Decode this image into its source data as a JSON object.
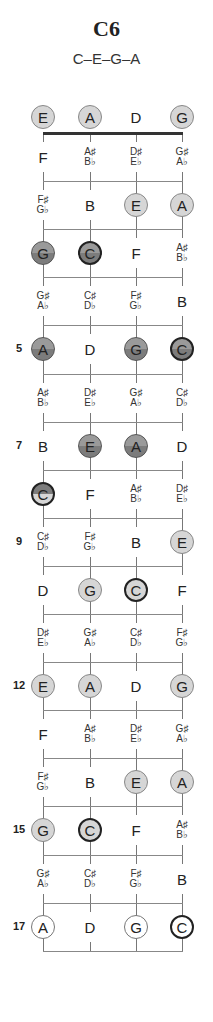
{
  "chord": {
    "name": "C6",
    "notes": "C–E–G–A"
  },
  "diagram": {
    "strings": [
      "E",
      "A",
      "D",
      "G"
    ],
    "string_x": [
      43,
      90,
      136,
      182
    ],
    "nut_y": 133,
    "fret_pitch": 48.1,
    "fret_count": 17,
    "marked_frets": [
      {
        "fret": 5,
        "label": "5"
      },
      {
        "fret": 7,
        "label": "7"
      },
      {
        "fret": 9,
        "label": "9"
      },
      {
        "fret": 12,
        "label": "12"
      },
      {
        "fret": 15,
        "label": "15"
      },
      {
        "fret": 17,
        "label": "17"
      }
    ],
    "rows": [
      {
        "fret": 0,
        "cells": [
          {
            "text": "E",
            "style": "light"
          },
          {
            "text": "A",
            "style": "light"
          },
          {
            "text": "D",
            "style": "none"
          },
          {
            "text": "G",
            "style": "light"
          }
        ]
      },
      {
        "fret": 1,
        "cells": [
          {
            "text": "F",
            "style": "none"
          },
          {
            "sharp": "A♯",
            "flat": "B♭"
          },
          {
            "sharp": "D♯",
            "flat": "E♭"
          },
          {
            "sharp": "G♯",
            "flat": "A♭"
          }
        ]
      },
      {
        "fret": 2,
        "cells": [
          {
            "sharp": "F♯",
            "flat": "G♭"
          },
          {
            "text": "B",
            "style": "none"
          },
          {
            "text": "E",
            "style": "light"
          },
          {
            "text": "A",
            "style": "light"
          }
        ]
      },
      {
        "fret": 3,
        "cells": [
          {
            "text": "G",
            "style": "dark"
          },
          {
            "text": "C",
            "style": "root-dark"
          },
          {
            "text": "F",
            "style": "none"
          },
          {
            "sharp": "A♯",
            "flat": "B♭"
          }
        ]
      },
      {
        "fret": 4,
        "cells": [
          {
            "sharp": "G♯",
            "flat": "A♭"
          },
          {
            "sharp": "C♯",
            "flat": "D♭"
          },
          {
            "sharp": "F♯",
            "flat": "G♭"
          },
          {
            "text": "B",
            "style": "none"
          }
        ]
      },
      {
        "fret": 5,
        "cells": [
          {
            "text": "A",
            "style": "dark"
          },
          {
            "text": "D",
            "style": "none"
          },
          {
            "text": "G",
            "style": "dark"
          },
          {
            "text": "C",
            "style": "root-dark"
          }
        ]
      },
      {
        "fret": 6,
        "cells": [
          {
            "sharp": "A♯",
            "flat": "B♭"
          },
          {
            "sharp": "D♯",
            "flat": "E♭"
          },
          {
            "sharp": "G♯",
            "flat": "A♭"
          },
          {
            "sharp": "C♯",
            "flat": "D♭"
          }
        ]
      },
      {
        "fret": 7,
        "cells": [
          {
            "text": "B",
            "style": "none"
          },
          {
            "text": "E",
            "style": "dark"
          },
          {
            "text": "A",
            "style": "dark"
          },
          {
            "text": "D",
            "style": "none"
          }
        ]
      },
      {
        "fret": 8,
        "cells": [
          {
            "text": "C",
            "style": "root-split"
          },
          {
            "text": "F",
            "style": "none"
          },
          {
            "sharp": "A♯",
            "flat": "B♭"
          },
          {
            "sharp": "D♯",
            "flat": "E♭"
          }
        ]
      },
      {
        "fret": 9,
        "cells": [
          {
            "sharp": "C♯",
            "flat": "D♭"
          },
          {
            "sharp": "F♯",
            "flat": "G♭"
          },
          {
            "text": "B",
            "style": "none"
          },
          {
            "text": "E",
            "style": "light"
          }
        ]
      },
      {
        "fret": 10,
        "cells": [
          {
            "text": "D",
            "style": "none"
          },
          {
            "text": "G",
            "style": "light"
          },
          {
            "text": "C",
            "style": "root-light"
          },
          {
            "text": "F",
            "style": "none"
          }
        ]
      },
      {
        "fret": 11,
        "cells": [
          {
            "sharp": "D♯",
            "flat": "E♭"
          },
          {
            "sharp": "G♯",
            "flat": "A♭"
          },
          {
            "sharp": "C♯",
            "flat": "D♭"
          },
          {
            "sharp": "F♯",
            "flat": "G♭"
          }
        ]
      },
      {
        "fret": 12,
        "cells": [
          {
            "text": "E",
            "style": "light"
          },
          {
            "text": "A",
            "style": "light"
          },
          {
            "text": "D",
            "style": "none"
          },
          {
            "text": "G",
            "style": "light"
          }
        ]
      },
      {
        "fret": 13,
        "cells": [
          {
            "text": "F",
            "style": "none"
          },
          {
            "sharp": "A♯",
            "flat": "B♭"
          },
          {
            "sharp": "D♯",
            "flat": "E♭"
          },
          {
            "sharp": "G♯",
            "flat": "A♭"
          }
        ]
      },
      {
        "fret": 14,
        "cells": [
          {
            "sharp": "F♯",
            "flat": "G♭"
          },
          {
            "text": "B",
            "style": "none"
          },
          {
            "text": "E",
            "style": "light"
          },
          {
            "text": "A",
            "style": "light"
          }
        ]
      },
      {
        "fret": 15,
        "cells": [
          {
            "text": "G",
            "style": "light"
          },
          {
            "text": "C",
            "style": "root-light"
          },
          {
            "text": "F",
            "style": "none"
          },
          {
            "sharp": "A♯",
            "flat": "B♭"
          }
        ]
      },
      {
        "fret": 16,
        "cells": [
          {
            "sharp": "G♯",
            "flat": "A♭"
          },
          {
            "sharp": "C♯",
            "flat": "D♭"
          },
          {
            "sharp": "F♯",
            "flat": "G♭"
          },
          {
            "text": "B",
            "style": "none"
          }
        ]
      },
      {
        "fret": 17,
        "cells": [
          {
            "text": "A",
            "style": "outline"
          },
          {
            "text": "D",
            "style": "none"
          },
          {
            "text": "G",
            "style": "outline"
          },
          {
            "text": "C",
            "style": "root-outline"
          }
        ]
      }
    ]
  }
}
